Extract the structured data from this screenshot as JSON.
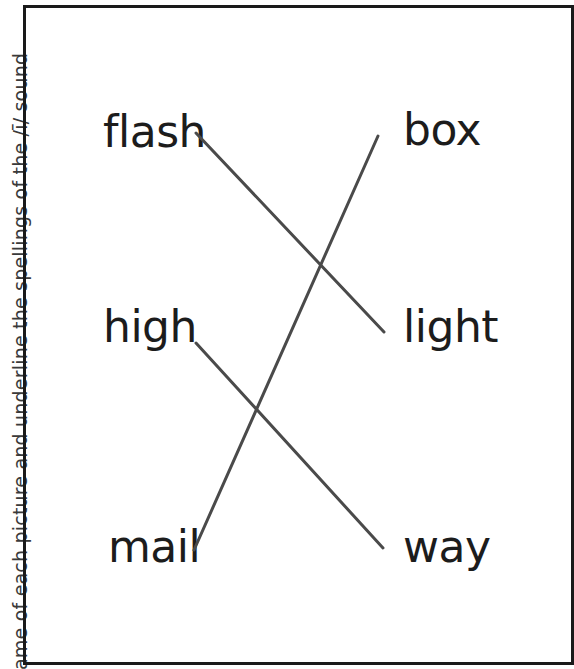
{
  "instruction_side_text": "ame of each picture and underline the spellings of the /ī/ sound",
  "left_words": [
    "flash",
    "high",
    "mail"
  ],
  "right_words": [
    "box",
    "light",
    "way"
  ],
  "matches": [
    {
      "from": "flash",
      "to": "light"
    },
    {
      "from": "high",
      "to": "way"
    },
    {
      "from": "mail",
      "to": "box"
    }
  ],
  "colors": {
    "line": "#4a4a4a",
    "border": "#1a1a1a",
    "text": "#1c1c1c"
  }
}
